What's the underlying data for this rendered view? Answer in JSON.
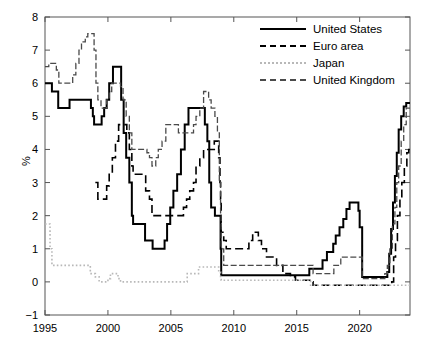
{
  "chart_data": {
    "type": "line",
    "title": "",
    "subtitle": "",
    "xlabel": "",
    "ylabel": "%",
    "xlim": [
      1995,
      2024
    ],
    "ylim": [
      -1,
      8
    ],
    "xticks": [
      1995,
      2000,
      2005,
      2010,
      2015,
      2020
    ],
    "yticks": [
      -1,
      0,
      1,
      2,
      3,
      4,
      5,
      6,
      7,
      8
    ],
    "xtick_labels": [
      "1995",
      "2000",
      "2005",
      "2010",
      "2015",
      "2020"
    ],
    "ytick_labels": [
      "-1",
      "0",
      "1",
      "2",
      "3",
      "4",
      "5",
      "6",
      "7",
      "8"
    ],
    "grid": false,
    "legend_position": "top-right",
    "series": [
      {
        "name": "United States",
        "style": "solid",
        "color": "#000000",
        "points": [
          [
            1995.0,
            6.0
          ],
          [
            1995.5,
            6.0
          ],
          [
            1995.55,
            5.75
          ],
          [
            1996.0,
            5.75
          ],
          [
            1996.05,
            5.25
          ],
          [
            1996.9,
            5.25
          ],
          [
            1996.95,
            5.5
          ],
          [
            1998.6,
            5.5
          ],
          [
            1998.65,
            5.25
          ],
          [
            1998.8,
            5.0
          ],
          [
            1998.9,
            4.75
          ],
          [
            1999.4,
            4.75
          ],
          [
            1999.5,
            5.0
          ],
          [
            1999.7,
            5.25
          ],
          [
            1999.9,
            5.5
          ],
          [
            2000.1,
            6.0
          ],
          [
            2000.4,
            6.5
          ],
          [
            2001.0,
            6.5
          ],
          [
            2001.05,
            5.5
          ],
          [
            2001.25,
            4.5
          ],
          [
            2001.45,
            3.75
          ],
          [
            2001.7,
            3.0
          ],
          [
            2001.9,
            2.0
          ],
          [
            2002.0,
            1.75
          ],
          [
            2002.9,
            1.75
          ],
          [
            2002.95,
            1.25
          ],
          [
            2003.5,
            1.25
          ],
          [
            2003.55,
            1.0
          ],
          [
            2004.4,
            1.0
          ],
          [
            2004.5,
            1.25
          ],
          [
            2004.7,
            1.75
          ],
          [
            2004.95,
            2.25
          ],
          [
            2005.2,
            2.75
          ],
          [
            2005.5,
            3.25
          ],
          [
            2005.8,
            4.0
          ],
          [
            2006.1,
            4.75
          ],
          [
            2006.4,
            5.25
          ],
          [
            2007.6,
            5.25
          ],
          [
            2007.7,
            4.75
          ],
          [
            2007.9,
            4.25
          ],
          [
            2008.05,
            3.0
          ],
          [
            2008.2,
            2.25
          ],
          [
            2008.5,
            2.0
          ],
          [
            2008.85,
            2.0
          ],
          [
            2008.95,
            1.0
          ],
          [
            2009.0,
            0.2
          ],
          [
            2015.9,
            0.2
          ],
          [
            2016.0,
            0.4
          ],
          [
            2016.95,
            0.4
          ],
          [
            2017.05,
            0.65
          ],
          [
            2017.4,
            0.9
          ],
          [
            2017.9,
            1.15
          ],
          [
            2018.1,
            1.4
          ],
          [
            2018.4,
            1.65
          ],
          [
            2018.7,
            1.9
          ],
          [
            2018.95,
            2.2
          ],
          [
            2019.2,
            2.4
          ],
          [
            2019.8,
            2.4
          ],
          [
            2019.9,
            2.15
          ],
          [
            2020.0,
            1.65
          ],
          [
            2020.2,
            0.15
          ],
          [
            2022.1,
            0.15
          ],
          [
            2022.2,
            0.3
          ],
          [
            2022.35,
            0.85
          ],
          [
            2022.5,
            1.6
          ],
          [
            2022.65,
            2.4
          ],
          [
            2022.8,
            3.2
          ],
          [
            2022.95,
            3.9
          ],
          [
            2023.1,
            4.6
          ],
          [
            2023.3,
            5.0
          ],
          [
            2023.5,
            5.3
          ],
          [
            2023.7,
            5.4
          ],
          [
            2024.0,
            5.4
          ]
        ]
      },
      {
        "name": "Euro area",
        "style": "dashed",
        "color": "#000000",
        "points": [
          [
            1999.0,
            3.0
          ],
          [
            1999.15,
            3.0
          ],
          [
            1999.2,
            2.5
          ],
          [
            1999.8,
            2.5
          ],
          [
            1999.9,
            2.9
          ],
          [
            2000.1,
            3.25
          ],
          [
            2000.35,
            3.75
          ],
          [
            2000.6,
            4.25
          ],
          [
            2000.85,
            4.75
          ],
          [
            2001.4,
            4.75
          ],
          [
            2001.5,
            4.5
          ],
          [
            2001.7,
            4.0
          ],
          [
            2001.9,
            3.5
          ],
          [
            2002.0,
            3.25
          ],
          [
            2002.9,
            3.25
          ],
          [
            2003.0,
            2.75
          ],
          [
            2003.3,
            2.5
          ],
          [
            2003.5,
            2.0
          ],
          [
            2005.9,
            2.0
          ],
          [
            2006.0,
            2.25
          ],
          [
            2006.25,
            2.5
          ],
          [
            2006.5,
            2.75
          ],
          [
            2006.8,
            3.0
          ],
          [
            2007.0,
            3.5
          ],
          [
            2007.3,
            3.75
          ],
          [
            2007.6,
            4.0
          ],
          [
            2008.0,
            4.0
          ],
          [
            2008.45,
            4.25
          ],
          [
            2008.8,
            3.75
          ],
          [
            2008.9,
            3.0
          ],
          [
            2008.95,
            2.5
          ],
          [
            2009.0,
            1.5
          ],
          [
            2009.2,
            1.25
          ],
          [
            2009.4,
            1.0
          ],
          [
            2010.9,
            1.0
          ],
          [
            2011.2,
            1.25
          ],
          [
            2011.5,
            1.5
          ],
          [
            2011.8,
            1.5
          ],
          [
            2011.95,
            1.25
          ],
          [
            2012.2,
            1.0
          ],
          [
            2012.6,
            0.75
          ],
          [
            2013.4,
            0.5
          ],
          [
            2013.9,
            0.25
          ],
          [
            2014.5,
            0.15
          ],
          [
            2014.9,
            0.05
          ],
          [
            2016.2,
            0.0
          ],
          [
            2016.3,
            -0.1
          ],
          [
            2022.4,
            -0.1
          ],
          [
            2022.55,
            0.0
          ],
          [
            2022.7,
            0.75
          ],
          [
            2022.85,
            1.25
          ],
          [
            2023.0,
            2.0
          ],
          [
            2023.2,
            2.5
          ],
          [
            2023.35,
            3.0
          ],
          [
            2023.55,
            3.5
          ],
          [
            2023.75,
            3.9
          ],
          [
            2023.9,
            4.0
          ],
          [
            2024.0,
            4.0
          ]
        ]
      },
      {
        "name": "Japan",
        "style": "dotted",
        "color": "#b8b8b8",
        "points": [
          [
            1995.0,
            1.75
          ],
          [
            1995.3,
            1.75
          ],
          [
            1995.4,
            1.0
          ],
          [
            1995.55,
            0.5
          ],
          [
            1996.9,
            0.5
          ],
          [
            1997.0,
            0.5
          ],
          [
            1998.5,
            0.5
          ],
          [
            1998.6,
            0.25
          ],
          [
            1999.0,
            0.15
          ],
          [
            1999.3,
            0.0
          ],
          [
            1999.9,
            0.0
          ],
          [
            2000.0,
            0.1
          ],
          [
            2000.2,
            0.25
          ],
          [
            2000.6,
            0.25
          ],
          [
            2000.8,
            0.1
          ],
          [
            2001.0,
            0.0
          ],
          [
            2001.2,
            0.0
          ],
          [
            2006.0,
            0.0
          ],
          [
            2006.3,
            0.25
          ],
          [
            2006.6,
            0.25
          ],
          [
            2007.2,
            0.45
          ],
          [
            2008.6,
            0.45
          ],
          [
            2008.8,
            0.3
          ],
          [
            2008.95,
            0.1
          ],
          [
            2009.0,
            0.05
          ],
          [
            2013.0,
            0.05
          ],
          [
            2013.5,
            0.05
          ],
          [
            2015.9,
            0.05
          ],
          [
            2016.1,
            -0.1
          ],
          [
            2024.0,
            -0.1
          ]
        ]
      },
      {
        "name": "United Kingdom",
        "style": "dashdot",
        "color": "#4a4a4a",
        "points": [
          [
            1995.0,
            6.5
          ],
          [
            1995.3,
            6.6
          ],
          [
            1995.6,
            6.6
          ],
          [
            1995.9,
            6.4
          ],
          [
            1996.1,
            6.0
          ],
          [
            1996.4,
            6.0
          ],
          [
            1997.0,
            6.0
          ],
          [
            1997.2,
            6.25
          ],
          [
            1997.45,
            6.6
          ],
          [
            1997.7,
            7.0
          ],
          [
            1997.9,
            7.25
          ],
          [
            1998.2,
            7.4
          ],
          [
            1998.4,
            7.5
          ],
          [
            1998.7,
            7.5
          ],
          [
            1998.9,
            7.0
          ],
          [
            1999.05,
            6.0
          ],
          [
            1999.2,
            5.5
          ],
          [
            1999.45,
            5.25
          ],
          [
            1999.7,
            5.25
          ],
          [
            1999.9,
            5.5
          ],
          [
            2000.1,
            5.75
          ],
          [
            2000.3,
            6.0
          ],
          [
            2000.6,
            6.0
          ],
          [
            2001.0,
            5.9
          ],
          [
            2001.2,
            5.5
          ],
          [
            2001.45,
            5.0
          ],
          [
            2001.7,
            4.5
          ],
          [
            2001.9,
            4.0
          ],
          [
            2002.0,
            4.0
          ],
          [
            2002.9,
            4.0
          ],
          [
            2003.1,
            3.9
          ],
          [
            2003.3,
            3.75
          ],
          [
            2003.5,
            3.5
          ],
          [
            2003.8,
            3.75
          ],
          [
            2004.0,
            4.0
          ],
          [
            2004.3,
            4.25
          ],
          [
            2004.6,
            4.75
          ],
          [
            2005.3,
            4.75
          ],
          [
            2005.6,
            4.5
          ],
          [
            2006.0,
            4.5
          ],
          [
            2006.5,
            4.5
          ],
          [
            2006.8,
            4.75
          ],
          [
            2007.0,
            5.0
          ],
          [
            2007.3,
            5.25
          ],
          [
            2007.6,
            5.75
          ],
          [
            2007.9,
            5.75
          ],
          [
            2008.0,
            5.5
          ],
          [
            2008.2,
            5.25
          ],
          [
            2008.5,
            5.0
          ],
          [
            2008.7,
            4.5
          ],
          [
            2008.85,
            3.0
          ],
          [
            2008.95,
            2.0
          ],
          [
            2009.0,
            1.0
          ],
          [
            2009.2,
            0.5
          ],
          [
            2016.0,
            0.5
          ],
          [
            2016.3,
            0.25
          ],
          [
            2017.8,
            0.25
          ],
          [
            2017.95,
            0.5
          ],
          [
            2018.5,
            0.75
          ],
          [
            2019.0,
            0.75
          ],
          [
            2020.1,
            0.75
          ],
          [
            2020.2,
            0.1
          ],
          [
            2021.9,
            0.1
          ],
          [
            2022.0,
            0.25
          ],
          [
            2022.2,
            0.5
          ],
          [
            2022.4,
            1.0
          ],
          [
            2022.6,
            1.75
          ],
          [
            2022.8,
            2.25
          ],
          [
            2022.95,
            3.0
          ],
          [
            2023.1,
            3.5
          ],
          [
            2023.3,
            4.25
          ],
          [
            2023.5,
            4.75
          ],
          [
            2023.7,
            5.25
          ],
          [
            2024.0,
            5.25
          ]
        ]
      }
    ]
  },
  "legend": {
    "entries": [
      {
        "label": "United States"
      },
      {
        "label": "Euro area"
      },
      {
        "label": "Japan"
      },
      {
        "label": "United Kingdom"
      }
    ]
  },
  "axis": {
    "y_title": "%"
  }
}
